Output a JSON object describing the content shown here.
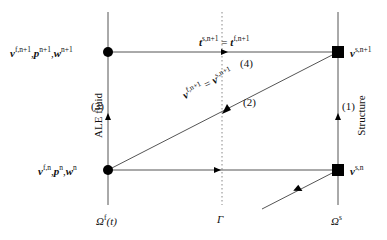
{
  "diagram": {
    "nodes": {
      "fluid_top": {
        "var1": "v",
        "sup1": "f,n+1",
        "var2": "p",
        "sup2": "n+1",
        "var3": "w",
        "sup3": "n+1"
      },
      "fluid_bottom": {
        "var1": "v",
        "sup1": "f,n",
        "var2": "p",
        "sup2": "n",
        "var3": "w",
        "sup3": "n"
      },
      "struct_top": {
        "var": "v",
        "sup": "s,n+1"
      },
      "struct_bottom": {
        "var": "v",
        "sup": "s,n"
      }
    },
    "edges": {
      "top_label": {
        "lhs": "t",
        "lhs_sup": "s,n+1",
        "eq": " = ",
        "rhs": "t",
        "rhs_sup": "f,n+1"
      },
      "diag_label": {
        "lhs": "v",
        "lhs_sup": "f,n+1",
        "eq": " = ",
        "rhs": "v",
        "rhs_sup": "s,n+1"
      }
    },
    "steps": {
      "s1": "(1)",
      "s2": "(2)",
      "s3": "(3)",
      "s4": "(4)"
    },
    "side_labels": {
      "left": "ALE fluid",
      "right": "Structure"
    },
    "domains": {
      "fluid": "Ω",
      "fluid_sup": "f",
      "fluid_arg": "(t)",
      "interface": "Γ",
      "solid": "Ω",
      "solid_sup": "s"
    }
  }
}
